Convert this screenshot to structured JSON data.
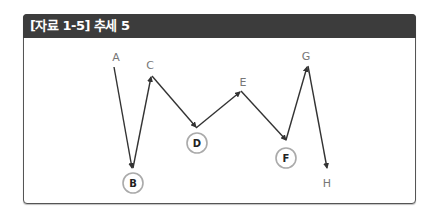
{
  "header": {
    "title": "[자료 1-5] 추세 5"
  },
  "colors": {
    "header_bg": "#3c3c3c",
    "line": "#333333",
    "label": "#777777",
    "circle": "#aaaaaa"
  },
  "points": [
    {
      "id": "A",
      "label": "A",
      "circled": false
    },
    {
      "id": "B",
      "label": "B",
      "circled": true
    },
    {
      "id": "C",
      "label": "C",
      "circled": false
    },
    {
      "id": "D",
      "label": "D",
      "circled": true
    },
    {
      "id": "E",
      "label": "E",
      "circled": false
    },
    {
      "id": "F",
      "label": "F",
      "circled": true
    },
    {
      "id": "G",
      "label": "G",
      "circled": false
    },
    {
      "id": "H",
      "label": "H",
      "circled": false
    }
  ],
  "path_order": [
    "A",
    "B",
    "C",
    "D",
    "E",
    "F",
    "G",
    "H"
  ]
}
